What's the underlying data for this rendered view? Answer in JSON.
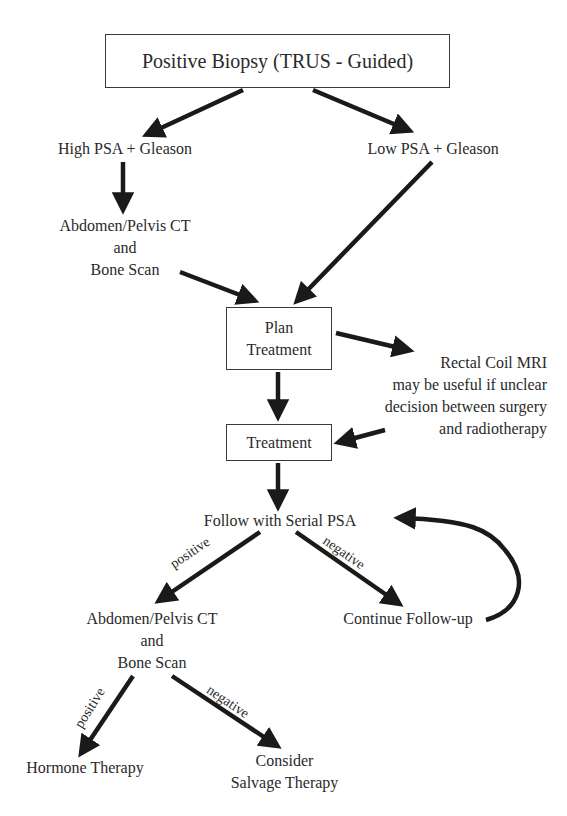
{
  "diagram": {
    "nodes": {
      "biopsy": "Positive Biopsy (TRUS - Guided)",
      "high_psa": "High PSA + Gleason",
      "low_psa": "Low PSA + Gleason",
      "ct_scan_1": [
        "Abdomen/Pelvis CT",
        "and",
        "Bone Scan"
      ],
      "plan_treatment": [
        "Plan",
        "Treatment"
      ],
      "mri_note": [
        "Rectal Coil MRI",
        "may be useful if unclear",
        "decision between surgery",
        "and radiotherapy"
      ],
      "treatment": "Treatment",
      "serial_psa": "Follow with Serial PSA",
      "ct_scan_2": [
        "Abdomen/Pelvis CT",
        "and",
        "Bone Scan"
      ],
      "continue_followup": "Continue Follow-up",
      "hormone_therapy": "Hormone Therapy",
      "salvage_therapy": [
        "Consider",
        "Salvage Therapy"
      ]
    },
    "edge_labels": {
      "psa_positive": "positive",
      "psa_negative": "negative",
      "scan_positive": "positive",
      "scan_negative": "negative"
    },
    "colors": {
      "arrow": "#1a1a1a",
      "text": "#2a2a2a",
      "box_border": "#3a3a3a"
    }
  }
}
